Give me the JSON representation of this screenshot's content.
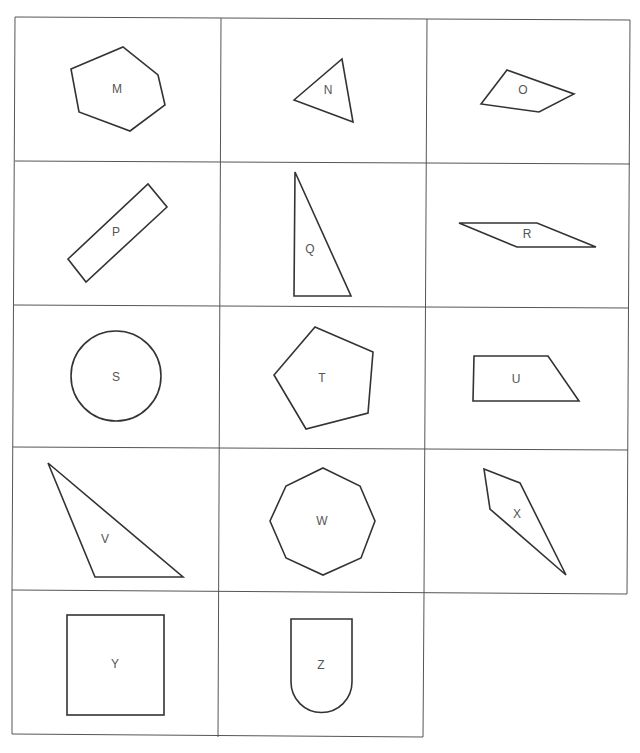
{
  "colors": {
    "line": "#333333",
    "grid": "#555555",
    "label": "#555555",
    "background": "#ffffff"
  },
  "cells": [
    {
      "label": "M",
      "shape": "hexagon"
    },
    {
      "label": "N",
      "shape": "triangle"
    },
    {
      "label": "O",
      "shape": "quadrilateral"
    },
    {
      "label": "P",
      "shape": "rectangle"
    },
    {
      "label": "Q",
      "shape": "right-triangle"
    },
    {
      "label": "R",
      "shape": "parallelogram"
    },
    {
      "label": "S",
      "shape": "circle"
    },
    {
      "label": "T",
      "shape": "pentagon"
    },
    {
      "label": "U",
      "shape": "trapezoid"
    },
    {
      "label": "V",
      "shape": "triangle"
    },
    {
      "label": "W",
      "shape": "octagon"
    },
    {
      "label": "X",
      "shape": "quadrilateral"
    },
    {
      "label": "Y",
      "shape": "rectangle"
    },
    {
      "label": "Z",
      "shape": "rounded-bottom-shape"
    }
  ]
}
